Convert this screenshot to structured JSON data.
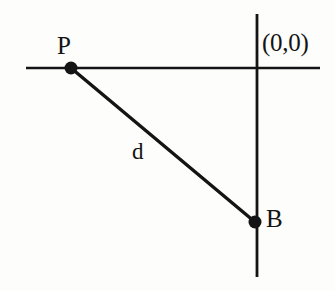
{
  "diagram": {
    "background_color": "#fdfdfc",
    "stroke_color": "#141414",
    "labels": {
      "point_p": "P",
      "point_b": "B",
      "distance": "d",
      "origin": "(0,0)"
    },
    "geometry": {
      "horizontal_axis": {
        "x1": 26,
        "y1": 68,
        "x2": 320,
        "y2": 68,
        "width": 2.4
      },
      "vertical_axis": {
        "x1": 257,
        "y1": 14,
        "x2": 257,
        "y2": 277,
        "width": 2.8
      },
      "segment_d": {
        "x1": 71,
        "y1": 68,
        "x2": 255,
        "y2": 222,
        "width": 3.4
      },
      "point_p": {
        "cx": 71,
        "cy": 68,
        "r": 6.5
      },
      "point_b": {
        "cx": 255,
        "cy": 222,
        "r": 6.5
      },
      "origin_point": {
        "cx": 257,
        "cy": 68
      }
    }
  },
  "chart_data": {
    "type": "scatter",
    "xlabel": "",
    "ylabel": "",
    "xlim": [
      -260,
      80
    ],
    "ylim": [
      -215,
      55
    ],
    "grid": false,
    "legend": null,
    "annotations": [
      {
        "text": "P",
        "x": -186,
        "y": 0
      },
      {
        "text": "B",
        "x": 0,
        "y": -154
      },
      {
        "text": "d",
        "x": -100,
        "y": -77
      },
      {
        "text": "(0,0)",
        "x": 0,
        "y": 0
      }
    ],
    "points": [
      {
        "name": "P",
        "x": -186,
        "y": 0
      },
      {
        "name": "B",
        "x": 0,
        "y": -154
      }
    ],
    "series": [
      {
        "name": "d",
        "type": "line",
        "x": [
          -186,
          0
        ],
        "values": [
          0,
          -154
        ]
      }
    ]
  }
}
